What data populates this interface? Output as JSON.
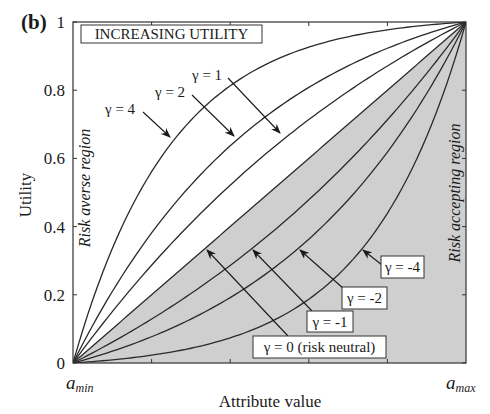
{
  "chart_data": {
    "type": "line",
    "panel_label": "(b)",
    "title": "INCREASING UTILITY",
    "xlabel": "Attribute value",
    "ylabel": "Utility",
    "x_tick_labels": [
      {
        "main": "a",
        "sub": "min",
        "pos": 0
      },
      {
        "main": "a",
        "sub": "max",
        "pos": 1
      }
    ],
    "y_ticks": [
      0,
      0.2,
      0.4,
      0.6,
      0.8,
      1
    ],
    "y_tick_labels": [
      "0",
      "0.2",
      "0.4",
      "0.6",
      "0.8",
      "1"
    ],
    "xlim": [
      0,
      1
    ],
    "ylim": [
      0,
      1
    ],
    "grid": false,
    "formula": "u(x) = (1 - exp(-gamma*x)) / (1 - exp(-gamma)); gamma=0 -> u(x)=x",
    "series": [
      {
        "name": "γ = 4",
        "gamma": 4,
        "x": [
          0,
          0.1,
          0.2,
          0.3,
          0.4,
          0.5,
          0.6,
          0.7,
          0.8,
          0.9,
          1
        ],
        "values": [
          0,
          0.336,
          0.561,
          0.712,
          0.813,
          0.881,
          0.926,
          0.957,
          0.977,
          0.991,
          1
        ]
      },
      {
        "name": "γ = 2",
        "gamma": 2,
        "x": [
          0,
          0.1,
          0.2,
          0.3,
          0.4,
          0.5,
          0.6,
          0.7,
          0.8,
          0.9,
          1
        ],
        "values": [
          0,
          0.21,
          0.381,
          0.522,
          0.636,
          0.731,
          0.808,
          0.871,
          0.922,
          0.964,
          1
        ]
      },
      {
        "name": "γ = 1",
        "gamma": 1,
        "x": [
          0,
          0.1,
          0.2,
          0.3,
          0.4,
          0.5,
          0.6,
          0.7,
          0.8,
          0.9,
          1
        ],
        "values": [
          0,
          0.151,
          0.287,
          0.41,
          0.521,
          0.622,
          0.713,
          0.796,
          0.87,
          0.938,
          1
        ]
      },
      {
        "name": "γ = 0 (risk neutral)",
        "gamma": 0,
        "x": [
          0,
          0.1,
          0.2,
          0.3,
          0.4,
          0.5,
          0.6,
          0.7,
          0.8,
          0.9,
          1
        ],
        "values": [
          0,
          0.1,
          0.2,
          0.3,
          0.4,
          0.5,
          0.6,
          0.7,
          0.8,
          0.9,
          1
        ]
      },
      {
        "name": "γ = -1",
        "gamma": -1,
        "x": [
          0,
          0.1,
          0.2,
          0.3,
          0.4,
          0.5,
          0.6,
          0.7,
          0.8,
          0.9,
          1
        ],
        "values": [
          0,
          0.062,
          0.13,
          0.204,
          0.287,
          0.378,
          0.479,
          0.59,
          0.713,
          0.849,
          1
        ]
      },
      {
        "name": "γ = -2",
        "gamma": -2,
        "x": [
          0,
          0.1,
          0.2,
          0.3,
          0.4,
          0.5,
          0.6,
          0.7,
          0.8,
          0.9,
          1
        ],
        "values": [
          0,
          0.036,
          0.078,
          0.129,
          0.192,
          0.269,
          0.364,
          0.478,
          0.619,
          0.79,
          1
        ]
      },
      {
        "name": "γ = -4",
        "gamma": -4,
        "x": [
          0,
          0.1,
          0.2,
          0.3,
          0.4,
          0.5,
          0.6,
          0.7,
          0.8,
          0.9,
          1
        ],
        "values": [
          0,
          0.009,
          0.023,
          0.043,
          0.073,
          0.119,
          0.186,
          0.287,
          0.439,
          0.665,
          1
        ]
      }
    ],
    "regions": [
      {
        "name": "Risk averse region",
        "side": "above diagonal",
        "fill": "#ffffff"
      },
      {
        "name": "Risk accepting region",
        "side": "below diagonal",
        "fill": "#cfcfcf"
      }
    ],
    "annotations": [
      {
        "text": "γ = 4",
        "boxed": false
      },
      {
        "text": "γ = 2",
        "boxed": false
      },
      {
        "text": "γ = 1",
        "boxed": false
      },
      {
        "text": "γ = 0 (risk neutral)",
        "boxed": true
      },
      {
        "text": "γ = -1",
        "boxed": true
      },
      {
        "text": "γ = -2",
        "boxed": true
      },
      {
        "text": "γ = -4",
        "boxed": true
      }
    ],
    "colors": {
      "line": "#2a2a2a",
      "shade": "#cfcfcf",
      "background": "#ffffff"
    }
  },
  "labels": {
    "panel": "(b)",
    "title_box": "INCREASING UTILITY",
    "xlabel": "Attribute value",
    "ylabel": "Utility",
    "risk_averse": "Risk averse region",
    "risk_accepting": "Risk accepting region",
    "a_min_main": "a",
    "a_min_sub": "min",
    "a_max_main": "a",
    "a_max_sub": "max",
    "ann_g4": "γ = 4",
    "ann_g2": "γ = 2",
    "ann_g1": "γ = 1",
    "ann_g0": "γ = 0 (risk neutral)",
    "ann_gm1": "γ = -1",
    "ann_gm2": "γ = -2",
    "ann_gm4": "γ = -4"
  }
}
